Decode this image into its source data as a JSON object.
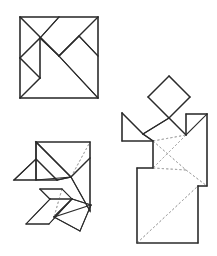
{
  "page": {
    "background_color": "#ffffff",
    "width": 217,
    "height": 256
  },
  "style": {
    "solid_stroke_color": "#2b2b2b",
    "dashed_stroke_color": "#a8a8a8",
    "fill_color": "#ffffff",
    "solid_stroke_width": 1.1,
    "dashed_stroke_width": 0.9,
    "dash_pattern": "2.2 2.2"
  },
  "figures": [
    {
      "id": "tangram-square",
      "name": "tangram-square-solution",
      "description": "Seven-piece tangram arranged into its base square with all internal piece edges drawn solid",
      "bounds": {
        "x": 20,
        "y": 17,
        "width": 78,
        "height": 81
      },
      "outline": "20,17 98,17 98,98 20,98",
      "solid_lines": [
        "20,17 98,17",
        "98,17 98,98",
        "98,98 20,98",
        "20,98 20,17",
        "20,17 59,56",
        "59,56 98,17",
        "20,58 40,38",
        "40,38 59,17",
        "40,38 59,56",
        "59,56 79,36",
        "79,36 98,56",
        "40,38 40,78",
        "40,78 20,98",
        "59,56 98,98",
        "20,58 40,78"
      ],
      "dashed_lines": []
    },
    {
      "id": "tangram-bird",
      "name": "tangram-bird-figure",
      "description": "Tangram pieces arranged into a bird-like figure with partly dashed internal edges",
      "bounds": {
        "x": 14,
        "y": 141,
        "width": 78,
        "height": 91
      },
      "solid_lines": [
        "36,142 90,142",
        "90,142 90,211",
        "36,142 71,177",
        "71,177 90,158",
        "36,142 36,180",
        "36,180 14,180",
        "14,180 36,159",
        "36,159 57,180",
        "36,180 57,180",
        "57,180 71,177",
        "71,177 90,211",
        "40,189 62,189",
        "62,189 72,199",
        "72,199 50,199",
        "50,199 40,189",
        "50,199 26,224",
        "26,224 49,224",
        "49,224 72,199",
        "72,199 54,217",
        "54,217 80,231",
        "80,231 91,205",
        "91,205 72,199",
        "54,217 91,205"
      ],
      "dashed_lines": [
        "71,177 90,142",
        "71,177 90,158",
        "62,189 54,217",
        "72,199 54,217"
      ]
    },
    {
      "id": "tangram-dancer",
      "name": "tangram-dancer-figure",
      "description": "Tangram pieces arranged into a standing dancer figure with a diamond head, outstretched arms and a long skirt",
      "bounds": {
        "x": 122,
        "y": 76,
        "width": 85,
        "height": 167
      },
      "head_diamond": "169,76 190,97 169,118 148,97",
      "solid_lines": [
        "169,76 190,97",
        "190,97 169,118",
        "169,118 148,97",
        "148,97 169,76",
        "122,113 143,134",
        "143,134 169,118",
        "169,118 186,135",
        "186,135 207,114",
        "207,114 207,186",
        "122,113 122,141",
        "122,141 153,141",
        "153,141 153,168",
        "153,168 137,168",
        "137,168 137,243",
        "137,243 198,243",
        "198,243 198,186",
        "198,186 207,186",
        "186,135 186,114",
        "186,114 207,114",
        "143,134 153,141"
      ],
      "dashed_lines": [
        "153,141 186,135",
        "153,141 186,170",
        "186,170 207,186",
        "153,168 186,170",
        "137,243 198,186",
        "186,135 153,168"
      ]
    }
  ]
}
